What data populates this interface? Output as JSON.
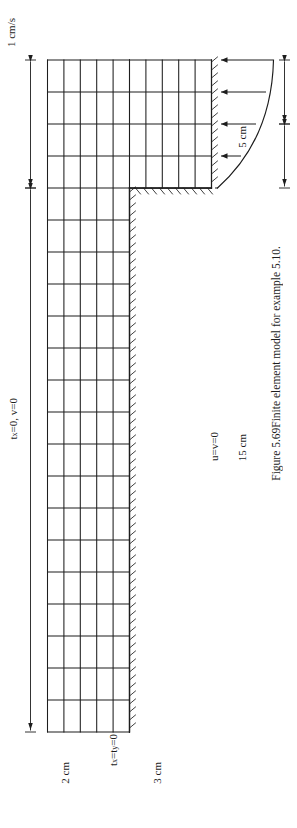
{
  "figure": {
    "caption_number": "Figure 5.69",
    "caption_text": "Finite element model for example 5.10.",
    "inlet_velocity_label": "1 cm/s",
    "left_boundary_label_parts": {
      "t": "t",
      "sub": "x",
      "rest": "=0, v=0"
    },
    "bottom_boundary_label_parts": {
      "t1": "t",
      "sub1": "x",
      "eq": "=t",
      "sub2": "y",
      "rest": "=0"
    },
    "right_boundary_label": "u=v=0",
    "dim_width_left": "2 cm",
    "dim_width_right": "3 cm",
    "dim_height_top": "5 cm",
    "dim_height_bottom": "15 cm",
    "colors": {
      "line": "#1d1d1d",
      "background": "#ffffff"
    },
    "mesh": {
      "narrow_columns": 4,
      "narrow_rows": 5,
      "wide_columns": 10,
      "wide_rows": 11,
      "element_type": "quadrilateral"
    },
    "icon_names": [
      "velocity-profile-arrow",
      "hatched-wall-boundary",
      "dimension-arrow"
    ]
  }
}
